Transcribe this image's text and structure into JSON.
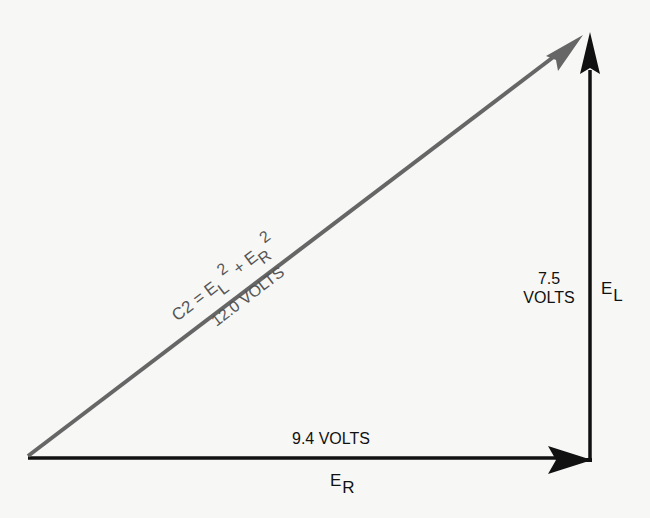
{
  "diagram": {
    "type": "vector-triangle",
    "colors": {
      "background": "#f7f7f5",
      "legs": "#111111",
      "hypotenuse": "#666666",
      "hypotenuse_text": "#555555"
    },
    "hypotenuse": {
      "formula_base": "C2 = E",
      "formula_sub1": "L",
      "formula_sup1": "2",
      "formula_plus": " + E",
      "formula_sub2": "R",
      "formula_sup2": "2",
      "value_label": "12.0 VOLTS"
    },
    "vertical_leg": {
      "value_line1": "7.5",
      "value_line2": "VOLTS",
      "name_base": "E",
      "name_sub": "L"
    },
    "horizontal_leg": {
      "value_label": "9.4 VOLTS",
      "name_base": "E",
      "name_sub": "R"
    }
  }
}
